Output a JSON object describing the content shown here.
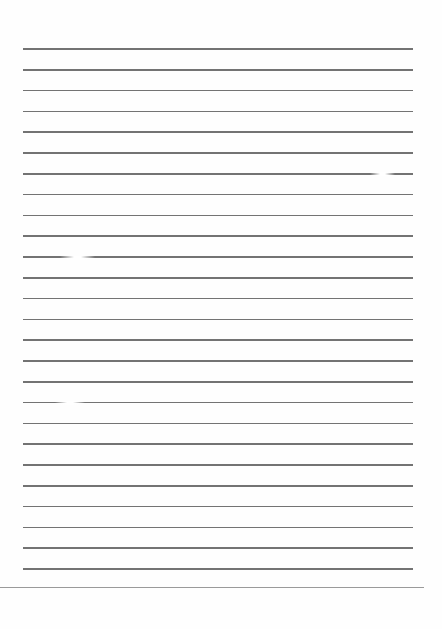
{
  "page": {
    "type": "lined-paper",
    "background": "#fefefe",
    "rule_color": "#5a5a5a",
    "edge_color": "#9a9a9a",
    "rule_left": 23,
    "rule_right": 413,
    "rule_count": 26,
    "first_rule_y": 49,
    "rule_spacing": 20.8,
    "bottom_edge": {
      "y": 587,
      "left": 0,
      "right": 424
    },
    "faded_spots": [
      {
        "y": 258,
        "x": 60,
        "width": 35
      },
      {
        "y": 403,
        "x": 55,
        "width": 30
      },
      {
        "y": 174,
        "x": 370,
        "width": 25
      }
    ]
  }
}
